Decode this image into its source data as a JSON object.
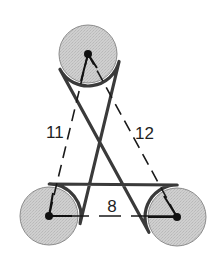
{
  "diagram": {
    "type": "belt-and-pulleys",
    "pulleys": [
      {
        "id": "top",
        "name": "top-pulley"
      },
      {
        "id": "left",
        "name": "bottom-left-pulley"
      },
      {
        "id": "right",
        "name": "bottom-right-pulley"
      }
    ],
    "distances": [
      {
        "from": "top",
        "to": "left",
        "label": "11"
      },
      {
        "from": "top",
        "to": "right",
        "label": "12"
      },
      {
        "from": "left",
        "to": "right",
        "label": "8"
      }
    ],
    "colors": {
      "pulley_fill": "#c8c8c8",
      "pulley_stroke": "#8a8a8a",
      "belt": "#3a3a3a",
      "line": "#1a1a1a"
    }
  }
}
